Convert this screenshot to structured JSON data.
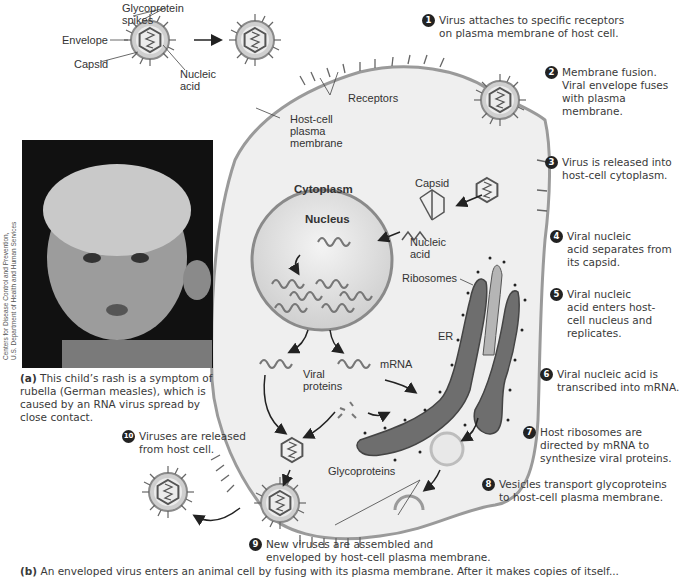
{
  "figure": {
    "virus_labels": {
      "glycoprotein_spikes": "Glycoprotein\nspikes",
      "envelope": "Envelope",
      "capsid": "Capsid",
      "nucleic_acid": "Nucleic\nacid"
    },
    "cell_labels": {
      "receptors": "Receptors",
      "host_cell_membrane": "Host-cell\nplasma\nmembrane",
      "cytoplasm": "Cytoplasm",
      "nucleus": "Nucleus",
      "capsid": "Capsid",
      "nucleic_acid": "Nucleic\nacid",
      "ribosomes": "Ribosomes",
      "er": "ER",
      "mrna": "mRNA",
      "viral_proteins": "Viral\nproteins",
      "glycoproteins": "Glycoproteins"
    },
    "steps": [
      {
        "num": "1",
        "text": "Virus attaches to specific receptors\non plasma membrane of host cell."
      },
      {
        "num": "2",
        "text": "Membrane fusion.\nViral envelope fuses\nwith plasma membrane."
      },
      {
        "num": "3",
        "text": "Virus is released into\nhost-cell cytoplasm."
      },
      {
        "num": "4",
        "text": "Viral nucleic\nacid separates from\nits capsid."
      },
      {
        "num": "5",
        "text": "Viral nucleic\nacid enters host-\ncell nucleus and\nreplicates."
      },
      {
        "num": "6",
        "text": "Viral nucleic acid is\ntranscribed into mRNA."
      },
      {
        "num": "7",
        "text": "Host ribosomes are\ndirected by mRNA to\nsynthesize viral proteins."
      },
      {
        "num": "8",
        "text": "Vesicles transport glycoproteins\nto host-cell plasma membrane."
      },
      {
        "num": "9",
        "text": "New viruses are assembled and\nenveloped by host-cell plasma membrane."
      },
      {
        "num": "10",
        "text": "Viruses are released\nfrom host cell."
      }
    ],
    "caption_a": {
      "marker": "(a)",
      "text": " This child’s rash is a symptom of rubella (German measles), which is caused by an RNA virus spread by close contact."
    },
    "photo_credit": "Centers for Disease Control and Prevention,\nU.S. Department of Health and Human Services",
    "caption_b": {
      "marker": "(b)",
      "text": " An enveloped virus enters an animal cell by fusing with its plasma membrane. After it makes copies of itself..."
    },
    "colors": {
      "cell_fill": "#efefef",
      "membrane": "#9a9a9a",
      "nucleus_fill": "#e2e2e2",
      "er_fill": "#6e6e6e",
      "virus_envelope": "#c8c8c8",
      "step_badge": "#222222",
      "photo_bg": "#111111"
    }
  }
}
